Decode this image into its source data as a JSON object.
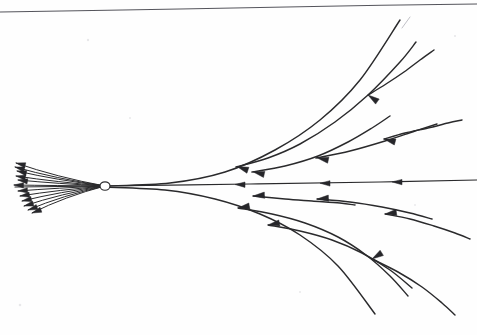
{
  "figure": {
    "medium": "pen on paper scan",
    "background_color": "#fefefe",
    "ink_color": "#2a2a2c",
    "rule_color": "#55555c",
    "width": 477,
    "height": 335,
    "focus_label": "",
    "caption": ""
  },
  "chart_data": {
    "type": "line",
    "xlabel": "",
    "ylabel": "",
    "grid": false,
    "legend": "none",
    "xlim": [
      0,
      477
    ],
    "ylim": [
      0,
      335
    ],
    "focus_point": {
      "x": 105,
      "y": 186,
      "rx": 5.0,
      "ry": 4.2
    },
    "axis_line": {
      "name": "central-axis",
      "points": [
        [
          15,
          187
        ],
        [
          105,
          186
        ],
        [
          250,
          184
        ],
        [
          380,
          182
        ],
        [
          477,
          180
        ]
      ],
      "arrow_heads": [
        {
          "x": 235,
          "y": 184.5,
          "angle": 181
        },
        {
          "x": 320,
          "y": 183.2,
          "angle": 181
        },
        {
          "x": 392,
          "y": 181.9,
          "angle": 181
        }
      ]
    },
    "page_rule": {
      "points": [
        [
          0,
          12
        ],
        [
          180,
          9
        ],
        [
          340,
          6
        ],
        [
          477,
          4
        ]
      ]
    },
    "corner_mark": {
      "points": [
        [
          402,
          28
        ],
        [
          410,
          17
        ]
      ]
    },
    "upper_curves": [
      {
        "name": "upper-envelope-curve",
        "points": [
          [
            105,
            186
          ],
          [
            170,
            183
          ],
          [
            225,
            172
          ],
          [
            275,
            150
          ],
          [
            320,
            120
          ],
          [
            360,
            80
          ],
          [
            400,
            20
          ]
        ],
        "arrow_heads": []
      },
      {
        "name": "upper-curve-2",
        "points": [
          [
            236,
            167
          ],
          [
            268,
            158
          ],
          [
            300,
            144
          ],
          [
            335,
            122
          ],
          [
            368,
            95
          ],
          [
            400,
            62
          ],
          [
            416,
            42
          ]
        ],
        "arrow_heads": [
          {
            "x": 237,
            "y": 166.5,
            "angle": 199
          }
        ]
      },
      {
        "name": "upper-curve-3",
        "points": [
          [
            252,
            172
          ],
          [
            285,
            166
          ],
          [
            318,
            156
          ],
          [
            348,
            142
          ],
          [
            372,
            128
          ],
          [
            390,
            116
          ]
        ],
        "arrow_heads": [
          {
            "x": 253,
            "y": 171.8,
            "angle": 193
          }
        ]
      },
      {
        "name": "upper-curve-4",
        "points": [
          [
            316,
            158
          ],
          [
            350,
            151
          ],
          [
            385,
            141
          ],
          [
            415,
            131
          ],
          [
            437,
            124
          ]
        ],
        "arrow_heads": [
          {
            "x": 317,
            "y": 157.8,
            "angle": 192
          }
        ]
      },
      {
        "name": "upper-curve-5",
        "points": [
          [
            384,
            139
          ],
          [
            405,
            133
          ],
          [
            428,
            128
          ],
          [
            448,
            123
          ],
          [
            462,
            120
          ]
        ],
        "arrow_heads": [
          {
            "x": 384,
            "y": 139,
            "angle": 195
          }
        ]
      },
      {
        "name": "upper-curve-6",
        "points": [
          [
            368,
            95
          ],
          [
            386,
            84
          ],
          [
            404,
            72
          ],
          [
            420,
            60
          ],
          [
            434,
            50
          ]
        ],
        "arrow_heads": [
          {
            "x": 368,
            "y": 95,
            "angle": 215
          }
        ]
      }
    ],
    "lower_curves": [
      {
        "name": "lower-envelope-curve",
        "points": [
          [
            105,
            187
          ],
          [
            165,
            190
          ],
          [
            215,
            199
          ],
          [
            260,
            214
          ],
          [
            300,
            235
          ],
          [
            338,
            266
          ],
          [
            375,
            314
          ]
        ],
        "arrow_heads": []
      },
      {
        "name": "lower-curve-2",
        "points": [
          [
            238,
            208
          ],
          [
            272,
            214
          ],
          [
            305,
            223
          ],
          [
            338,
            237
          ],
          [
            366,
            255
          ],
          [
            390,
            276
          ],
          [
            408,
            296
          ]
        ],
        "arrow_heads": [
          {
            "x": 238,
            "y": 208,
            "angle": 170
          }
        ]
      },
      {
        "name": "lower-curve-3",
        "points": [
          [
            253,
            196
          ],
          [
            285,
            199
          ],
          [
            312,
            201
          ],
          [
            340,
            203
          ],
          [
            355,
            205
          ]
        ],
        "arrow_heads": [
          {
            "x": 253,
            "y": 196,
            "angle": 176
          }
        ]
      },
      {
        "name": "lower-curve-4",
        "points": [
          [
            268,
            225
          ],
          [
            300,
            231
          ],
          [
            332,
            240
          ],
          [
            362,
            253
          ],
          [
            390,
            270
          ],
          [
            412,
            288
          ]
        ],
        "arrow_heads": [
          {
            "x": 268,
            "y": 225,
            "angle": 170
          }
        ]
      },
      {
        "name": "lower-curve-5",
        "points": [
          [
            317,
            199
          ],
          [
            350,
            202
          ],
          [
            382,
            207
          ],
          [
            410,
            213
          ],
          [
            432,
            219
          ]
        ],
        "arrow_heads": [
          {
            "x": 317,
            "y": 199,
            "angle": 176
          }
        ]
      },
      {
        "name": "lower-curve-6",
        "points": [
          [
            385,
            214
          ],
          [
            410,
            219
          ],
          [
            434,
            226
          ],
          [
            455,
            233
          ],
          [
            470,
            239
          ]
        ],
        "arrow_heads": [
          {
            "x": 385,
            "y": 214,
            "angle": 172
          }
        ]
      },
      {
        "name": "lower-curve-7",
        "points": [
          [
            372,
            259
          ],
          [
            398,
            272
          ],
          [
            422,
            287
          ],
          [
            442,
            303
          ],
          [
            455,
            315
          ]
        ],
        "arrow_heads": [
          {
            "x": 372,
            "y": 259,
            "angle": 148
          }
        ]
      }
    ],
    "left_brush": {
      "name": "left-fan-of-rays",
      "origin": {
        "x": 105,
        "y": 186
      },
      "ray_count": 12,
      "rays": [
        {
          "tip": [
            16,
            163
          ],
          "arrow_angle": 194
        },
        {
          "tip": [
            15,
            167
          ],
          "arrow_angle": 195
        },
        {
          "tip": [
            17,
            171
          ],
          "arrow_angle": 193
        },
        {
          "tip": [
            16,
            176
          ],
          "arrow_angle": 190
        },
        {
          "tip": [
            18,
            180
          ],
          "arrow_angle": 188
        },
        {
          "tip": [
            14,
            185
          ],
          "arrow_angle": 182
        },
        {
          "tip": [
            18,
            191
          ],
          "arrow_angle": 176
        },
        {
          "tip": [
            20,
            196
          ],
          "arrow_angle": 172
        },
        {
          "tip": [
            22,
            201
          ],
          "arrow_angle": 168
        },
        {
          "tip": [
            24,
            206
          ],
          "arrow_angle": 165
        },
        {
          "tip": [
            28,
            210
          ],
          "arrow_angle": 162
        },
        {
          "tip": [
            32,
            213
          ],
          "arrow_angle": 160
        }
      ]
    }
  }
}
